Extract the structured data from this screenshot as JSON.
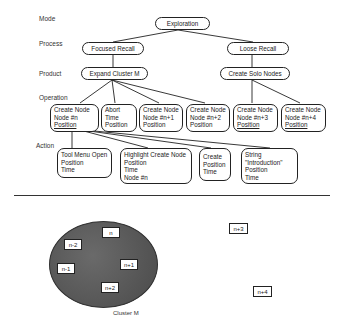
{
  "levels": {
    "mode": "Mode",
    "process": "Process",
    "product": "Product",
    "operation": "Operation",
    "action": "Action"
  },
  "mode": {
    "exploration": "Exploration"
  },
  "process": {
    "focused": "Focused Recall",
    "loose": "Loose Recall"
  },
  "product": {
    "expand": "Expand Cluster M",
    "solo": "Create Solo Nodes"
  },
  "operations": [
    [
      "Create Node",
      "Node #n",
      "Position"
    ],
    [
      "Abort",
      "Time",
      "Position"
    ],
    [
      "Create Node",
      "Node #n+1",
      "Position"
    ],
    [
      "Create Node",
      "Node #n+2",
      "Position"
    ],
    [
      "Create Node",
      "Node #n+3",
      "Position"
    ],
    [
      "Create Node",
      "Node #n+4",
      "Position"
    ]
  ],
  "actions": [
    [
      "Tool Menu Open",
      "Position",
      "Time"
    ],
    [
      "Highlight Create Node",
      "Position",
      "Time",
      "Node #n"
    ],
    [
      "Create",
      "Position",
      "Time"
    ],
    [
      "String",
      "\"Introduction\"",
      "Position",
      "Time"
    ]
  ],
  "cluster": {
    "label": "Cluster M",
    "nodes": [
      "n",
      "n-2",
      "n-1",
      "n+1",
      "n+2"
    ]
  },
  "solo_nodes": [
    "n+3",
    "n+4"
  ]
}
